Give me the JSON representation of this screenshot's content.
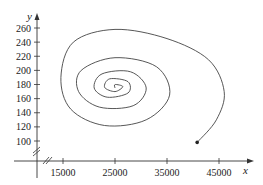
{
  "chart_data": {
    "type": "line",
    "title": "",
    "xlabel": "x",
    "ylabel": "y",
    "x_ticks": [
      15000,
      25000,
      35000,
      45000
    ],
    "y_ticks": [
      100,
      120,
      140,
      160,
      180,
      200,
      220,
      240,
      260
    ],
    "xlim": [
      10000,
      48000
    ],
    "ylim": [
      80,
      270
    ],
    "grid": false,
    "legend": null,
    "axis_breaks": [
      "x-axis near origin",
      "y-axis near origin"
    ],
    "series": [
      {
        "name": "trajectory",
        "start_point": {
          "x": 40800,
          "y": 98
        },
        "equilibrium": {
          "x": 25000,
          "y": 175
        },
        "points": [
          {
            "x": 40800,
            "y": 98
          },
          {
            "x": 44500,
            "y": 130
          },
          {
            "x": 46000,
            "y": 170
          },
          {
            "x": 43000,
            "y": 215
          },
          {
            "x": 35000,
            "y": 245
          },
          {
            "x": 25000,
            "y": 258
          },
          {
            "x": 17000,
            "y": 240
          },
          {
            "x": 14600,
            "y": 190
          },
          {
            "x": 16500,
            "y": 145
          },
          {
            "x": 23000,
            "y": 122
          },
          {
            "x": 31000,
            "y": 130
          },
          {
            "x": 35500,
            "y": 165
          },
          {
            "x": 33000,
            "y": 205
          },
          {
            "x": 25000,
            "y": 218
          },
          {
            "x": 18500,
            "y": 200
          },
          {
            "x": 18000,
            "y": 170
          },
          {
            "x": 22000,
            "y": 148
          },
          {
            "x": 28500,
            "y": 150
          },
          {
            "x": 31000,
            "y": 175
          },
          {
            "x": 28000,
            "y": 198
          },
          {
            "x": 22500,
            "y": 195
          },
          {
            "x": 21000,
            "y": 175
          },
          {
            "x": 23500,
            "y": 162
          },
          {
            "x": 27500,
            "y": 168
          },
          {
            "x": 27500,
            "y": 184
          },
          {
            "x": 24000,
            "y": 188
          },
          {
            "x": 23000,
            "y": 176
          },
          {
            "x": 25000,
            "y": 170
          },
          {
            "x": 26500,
            "y": 177
          },
          {
            "x": 25000,
            "y": 180
          },
          {
            "x": 25000,
            "y": 175
          }
        ]
      }
    ]
  },
  "axes": {
    "x_label": "x",
    "y_label": "y",
    "x_tick_labels": [
      "15000",
      "25000",
      "35000",
      "45000"
    ],
    "y_tick_labels": [
      "100",
      "120",
      "140",
      "160",
      "180",
      "200",
      "220",
      "240",
      "260"
    ]
  }
}
